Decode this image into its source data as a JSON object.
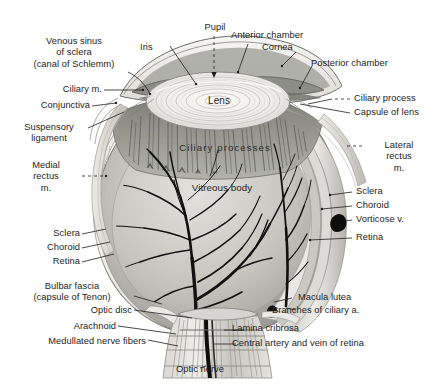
{
  "figure": {
    "style": "grayscale anatomical illustration",
    "background_color": "#ffffff",
    "text_color": "#1d1d1d"
  },
  "labels": {
    "venous_sinus": "Venous sinus\nof sclera\n(canal of Schlemm)",
    "iris": "Iris",
    "pupil": "Pupil",
    "anterior_chamber": "Anterior chamber",
    "cornea": "Cornea",
    "posterior_chamber": "Posterior chamber",
    "ciliary_m": "Ciliary m.",
    "conjunctiva": "Conjunctiva",
    "ciliary_process": "Ciliary process",
    "capsule_of_lens": "Capsule of lens",
    "suspensory_ligament": "Suspensory\nligament",
    "lateral_rectus": "Lateral\nrectus\nm.",
    "medial_rectus": "Medial\nrectus\nm.",
    "lens": "Lens",
    "ciliary_processes": "Ciliary processes",
    "vitreous_body": "Vitreous body",
    "sclera_right": "Sclera",
    "choroid_right": "Choroid",
    "vorticose_v": "Vorticose v.",
    "retina_right": "Retina",
    "sclera_left": "Sclera",
    "choroid_left": "Choroid",
    "retina_left": "Retina",
    "bulbar_fascia": "Bulbar fascia\n(capsule of Tenon)",
    "optic_disc": "Optic disc",
    "arachnoid": "Arachnoid",
    "medullated_nerve_fibers": "Medullated nerve fibers",
    "macula_lutea": "Macula lutea",
    "branches_of_ciliary_a": "Branches of ciliary a.",
    "lamina_cribrosa": "Lamina cribrosa",
    "central_artery_vein": "Central artery and vein of retina",
    "optic_nerve": "Optic nerve"
  },
  "colors": {
    "sclera": "#e8e7e3",
    "sclera_shadow": "#c9c8c3",
    "choroid": "#9a9a95",
    "ciliary_body": "#8b8b86",
    "vitreous": "#d6d5d1",
    "vitreous_shade": "#b8b7b2",
    "lens": "#f0efec",
    "iris": "#a9a9a4",
    "vessel": "#141414",
    "outline": "#4a4a46",
    "nerve": "#cfcec9"
  }
}
